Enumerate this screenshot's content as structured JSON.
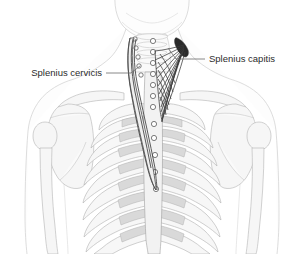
{
  "figure": {
    "width": 295,
    "height": 254,
    "background_color": "#ffffff",
    "view": "posterior",
    "style": "grayscale line drawing"
  },
  "labels": [
    {
      "id": "splenius-capitis",
      "text": "Splenius capitis",
      "side": "right",
      "text_x": 209,
      "text_y": 59,
      "leader": "M 205 59 L 176 59 L 168 48",
      "color": "#2b2b2b"
    },
    {
      "id": "splenius-cervicis",
      "text": "Splenius cervicis",
      "side": "left",
      "text_x": 102,
      "text_y": 73,
      "leader": "M 106 73 L 131 73 L 140 66",
      "color": "#2b2b2b"
    }
  ],
  "anatomy": {
    "body_outline": "head base, neck, shoulders, arms, torso",
    "skeleton": [
      "skull base",
      "cervical vertebrae",
      "thoracic vertebrae",
      "scapulae",
      "clavicles",
      "humeri",
      "rib cage"
    ],
    "muscles": [
      {
        "name": "Splenius capitis",
        "rendering": "dark hatched fan",
        "origin": "mastoid process / occiput (upper right)",
        "insertion": "spinous processes C7-T3",
        "fiber_count": 16,
        "color": "#3a3a3a"
      },
      {
        "name": "Splenius cervicis",
        "rendering": "narrow vertical strap",
        "origin": "transverse processes of upper cervical vertebrae",
        "insertion": "spinous processes T3-T6",
        "color": "#4a4a4a"
      }
    ],
    "vertebra_marker_count": 17,
    "rib_pair_count": 11
  },
  "colors": {
    "background": "#ffffff",
    "skin_outline": "#cfcfcf",
    "bone_fill": "#f6f6f6",
    "bone_outline": "#b3b3b3",
    "rib_shade": "#d9d9d9",
    "muscle_dark": "#3a3a3a",
    "label_text": "#2b2b2b",
    "leader_line": "#6a6a6a"
  }
}
